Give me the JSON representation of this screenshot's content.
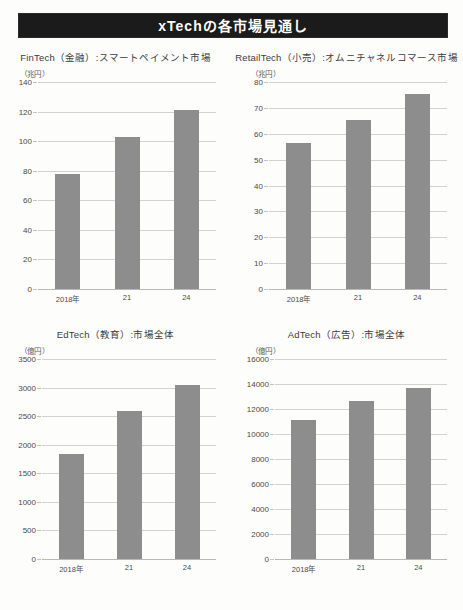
{
  "header": {
    "title": "xTechの各市場見通し",
    "banner_color": "#1b1b1b",
    "text_color": "#ffffff"
  },
  "style": {
    "bar_color": "#8d8d8d",
    "grid_color": "#d2d2d2",
    "background": "#fdfdfb"
  },
  "chart_data": [
    {
      "id": "fintech",
      "type": "bar",
      "title": "FinTech（金融）:スマートペイメント市場",
      "unit": "（兆円）",
      "ylabel": "兆円",
      "xlabel": "",
      "categories": [
        "2018年",
        "21",
        "24"
      ],
      "values": [
        78,
        102.5,
        121
      ],
      "ylim": [
        0,
        140
      ],
      "yticks": [
        0,
        20,
        40,
        60,
        80,
        100,
        120,
        140
      ],
      "ytick_labels": [
        "0",
        "20",
        "40",
        "60",
        "80",
        "100",
        "120",
        "140"
      ],
      "grid": true,
      "legend": "none"
    },
    {
      "id": "retailtech",
      "type": "bar",
      "title": "RetailTech（小売）:オムニチャネルコマース市場",
      "unit": "（兆円）",
      "ylabel": "兆円",
      "xlabel": "",
      "categories": [
        "2018年",
        "21",
        "24"
      ],
      "values": [
        56.5,
        65.5,
        75.5
      ],
      "ylim": [
        0,
        80
      ],
      "yticks": [
        0,
        10,
        20,
        30,
        40,
        50,
        60,
        70,
        80
      ],
      "ytick_labels": [
        "0",
        "10",
        "20",
        "30",
        "40",
        "50",
        "60",
        "70",
        "80"
      ],
      "grid": true,
      "legend": "none"
    },
    {
      "id": "edtech",
      "type": "bar",
      "title": "EdTech（教育）:市場全体",
      "unit": "（億円）",
      "ylabel": "億円",
      "xlabel": "",
      "categories": [
        "2018年",
        "21",
        "24"
      ],
      "values": [
        1830,
        2590,
        3040
      ],
      "ylim": [
        0,
        3500
      ],
      "yticks": [
        0,
        500,
        1000,
        1500,
        2000,
        2500,
        3000,
        3500
      ],
      "ytick_labels": [
        "0",
        "500",
        "1000",
        "1500",
        "2000",
        "2500",
        "3000",
        "3500"
      ],
      "grid": true,
      "legend": "none"
    },
    {
      "id": "adtech",
      "type": "bar",
      "title": "AdTech（広告）:市場全体",
      "unit": "（億円）",
      "ylabel": "億円",
      "xlabel": "",
      "categories": [
        "2018年",
        "21",
        "24"
      ],
      "values": [
        11150,
        12650,
        13650
      ],
      "ylim": [
        0,
        16000
      ],
      "yticks": [
        0,
        2000,
        4000,
        6000,
        8000,
        10000,
        12000,
        14000,
        16000
      ],
      "ytick_labels": [
        "0",
        "2000",
        "4000",
        "6000",
        "8000",
        "10000",
        "12000",
        "14000",
        "16000"
      ],
      "grid": true,
      "legend": "none"
    }
  ]
}
